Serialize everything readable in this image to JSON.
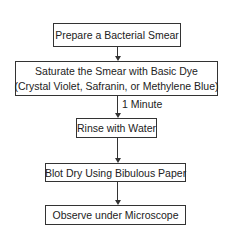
{
  "steps": [
    {
      "line1": "Prepare a Bacterial Smear"
    },
    {
      "line1": "Saturate the Smear with Basic Dye",
      "line2": "(Crystal Violet, Safranin, or Methylene Blue)"
    },
    {
      "line1": "Rinse with Water"
    },
    {
      "line1": "Blot Dry Using Bibulous Paper"
    },
    {
      "line1": "Observe under Microscope"
    }
  ],
  "connectors": [
    {
      "from": 0,
      "to": 1,
      "label": ""
    },
    {
      "from": 1,
      "to": 2,
      "label": "1 Minute"
    },
    {
      "from": 2,
      "to": 3,
      "label": ""
    },
    {
      "from": 3,
      "to": 4,
      "label": ""
    }
  ],
  "colors": {
    "stroke": "#333333",
    "text": "#222222",
    "background": "#ffffff"
  }
}
